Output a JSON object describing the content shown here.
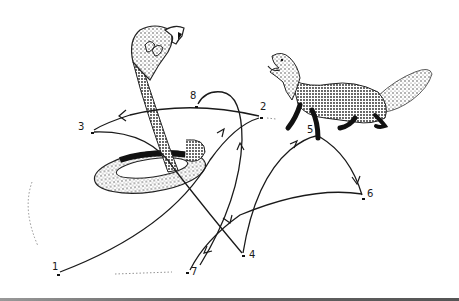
{
  "figure": {
    "subjects": [
      "cobra",
      "fox"
    ],
    "points": [
      {
        "id": "1",
        "label": "1",
        "x": 58,
        "y": 275
      },
      {
        "id": "2",
        "label": "2",
        "x": 261,
        "y": 118
      },
      {
        "id": "3",
        "label": "3",
        "x": 92,
        "y": 133
      },
      {
        "id": "4",
        "label": "4",
        "x": 243,
        "y": 256
      },
      {
        "id": "5",
        "label": "5",
        "x": 318,
        "y": 135
      },
      {
        "id": "6",
        "label": "6",
        "x": 363,
        "y": 199
      },
      {
        "id": "7",
        "label": "7",
        "x": 187,
        "y": 273
      },
      {
        "id": "8",
        "label": "8",
        "x": 196,
        "y": 107
      }
    ],
    "paths": [
      {
        "from": "1",
        "to": "2"
      },
      {
        "from": "2",
        "to": "3"
      },
      {
        "from": "3",
        "to": "4"
      },
      {
        "from": "4",
        "to": "5"
      },
      {
        "from": "5",
        "to": "6"
      },
      {
        "from": "6",
        "to": "7"
      },
      {
        "from": "7",
        "to": "8"
      }
    ],
    "colors": {
      "ink": "#1a1a1a",
      "background": "#ffffff"
    }
  }
}
